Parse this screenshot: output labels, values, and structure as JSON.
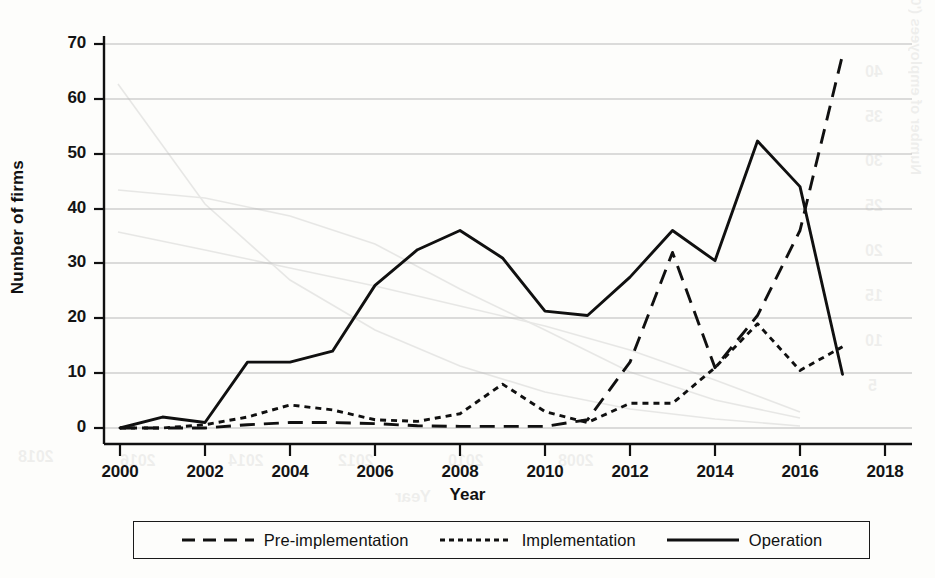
{
  "chart_data": {
    "type": "line",
    "title": "",
    "xlabel": "Year",
    "ylabel": "Number of firms",
    "xlim": [
      2000,
      2018
    ],
    "ylim": [
      0,
      70
    ],
    "xticks": [
      2000,
      2002,
      2004,
      2006,
      2008,
      2010,
      2012,
      2014,
      2016,
      2018
    ],
    "yticks": [
      0,
      10,
      20,
      30,
      40,
      50,
      60,
      70
    ],
    "grid": "horizontal",
    "legend_position": "bottom",
    "x": [
      2000,
      2001,
      2002,
      2003,
      2004,
      2005,
      2006,
      2007,
      2008,
      2009,
      2010,
      2011,
      2012,
      2013,
      2014,
      2015,
      2016,
      2017
    ],
    "series": [
      {
        "name": "Pre-implementation",
        "style": "long-dashed",
        "values": [
          0,
          0,
          0,
          0.6,
          1,
          1,
          0.8,
          0.4,
          0.3,
          0.3,
          0.3,
          1.5,
          12,
          32,
          11,
          20.5,
          36,
          68
        ]
      },
      {
        "name": "Implementation",
        "style": "dotted",
        "values": [
          0,
          0,
          0.6,
          2,
          4.2,
          3.3,
          1.5,
          1.2,
          2.6,
          8,
          3,
          1,
          4.5,
          4.5,
          11,
          19,
          10.5,
          14.8
        ]
      },
      {
        "name": "Operation",
        "style": "solid",
        "values": [
          0,
          2,
          1,
          12,
          12,
          14,
          26,
          32.5,
          36,
          31,
          21.3,
          20.5,
          27.5,
          36,
          30.5,
          52.3,
          44,
          9.8
        ]
      }
    ]
  },
  "axis": {
    "y_title": "Number of firms",
    "x_title": "Year",
    "y_tick_labels": [
      "70",
      "60",
      "50",
      "40",
      "30",
      "20",
      "10",
      "0"
    ],
    "x_tick_labels": [
      "2000",
      "2002",
      "2004",
      "2006",
      "2008",
      "2010",
      "2012",
      "2014",
      "2016",
      "2018"
    ]
  },
  "legend": {
    "items": [
      {
        "label": "Pre-implementation",
        "style": "long-dashed"
      },
      {
        "label": "Implementation",
        "style": "dotted"
      },
      {
        "label": "Operation",
        "style": "solid"
      }
    ]
  },
  "artifacts": {
    "showthrough_right_axis_title": "Number of employees ('000)",
    "showthrough_right_ticks": [
      "40",
      "35",
      "30",
      "25",
      "20",
      "15",
      "10",
      "5",
      "0"
    ],
    "showthrough_bottom_years": [
      "2018",
      "2016",
      "2014",
      "2012",
      "2010",
      "2008"
    ],
    "showthrough_bottom_title": "Year"
  }
}
